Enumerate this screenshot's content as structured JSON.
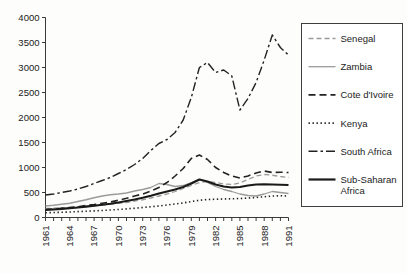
{
  "chart_data": {
    "type": "line",
    "title": "",
    "xlabel": "",
    "ylabel": "",
    "ylim": [
      0,
      4000
    ],
    "xlim": [
      1961,
      1991
    ],
    "yticks": [
      0,
      500,
      1000,
      1500,
      2000,
      2500,
      3000,
      3500,
      4000
    ],
    "ytick_labels": [
      "0",
      "500",
      "1000",
      "1500",
      "2000",
      "2500",
      "3000",
      "3500",
      "4000"
    ],
    "xticks": [
      1961,
      1964,
      1967,
      1970,
      1973,
      1976,
      1979,
      1982,
      1985,
      1988,
      1991
    ],
    "xtick_labels": [
      "1961",
      "1964",
      "1967",
      "1970",
      "1973",
      "1976",
      "1979",
      "1982",
      "1985",
      "1988",
      "1991"
    ],
    "xtick_rotation": 90,
    "x": [
      1961,
      1962,
      1963,
      1964,
      1965,
      1966,
      1967,
      1968,
      1969,
      1970,
      1971,
      1972,
      1973,
      1974,
      1975,
      1976,
      1977,
      1978,
      1979,
      1980,
      1981,
      1982,
      1983,
      1984,
      1985,
      1986,
      1987,
      1988,
      1989,
      1990,
      1991
    ],
    "grid": false,
    "legend_position": "right",
    "series": [
      {
        "name": "Senegal",
        "color": "#9a9a9a",
        "dash": "5,3",
        "width": 1.3,
        "values": [
          180,
          185,
          195,
          200,
          215,
          225,
          235,
          250,
          265,
          285,
          300,
          330,
          355,
          390,
          430,
          470,
          520,
          580,
          640,
          700,
          720,
          700,
          670,
          660,
          690,
          760,
          830,
          860,
          845,
          820,
          800
        ]
      },
      {
        "name": "Zambia",
        "color": "#9a9a9a",
        "dash": "0",
        "width": 1.3,
        "values": [
          230,
          245,
          265,
          285,
          320,
          355,
          395,
          430,
          455,
          470,
          490,
          530,
          560,
          600,
          680,
          660,
          620,
          640,
          700,
          760,
          700,
          620,
          560,
          520,
          470,
          440,
          430,
          470,
          520,
          500,
          480
        ]
      },
      {
        "name": "Cote d'Ivoire",
        "color": "#222222",
        "dash": "7,4",
        "width": 1.6,
        "values": [
          160,
          170,
          185,
          200,
          215,
          240,
          260,
          285,
          310,
          345,
          385,
          430,
          470,
          530,
          600,
          700,
          830,
          980,
          1180,
          1250,
          1160,
          1000,
          900,
          830,
          790,
          830,
          890,
          930,
          900,
          905,
          900
        ]
      },
      {
        "name": "Kenya",
        "color": "#222222",
        "dash": "1.4,2.6",
        "width": 1.6,
        "values": [
          95,
          100,
          105,
          110,
          118,
          125,
          132,
          140,
          150,
          160,
          172,
          185,
          200,
          215,
          230,
          250,
          270,
          290,
          320,
          345,
          360,
          365,
          370,
          375,
          380,
          390,
          400,
          415,
          430,
          435,
          430
        ]
      },
      {
        "name": "South Africa",
        "color": "#222222",
        "dash": "9,3,2.5,3",
        "width": 1.4,
        "values": [
          450,
          470,
          500,
          530,
          570,
          620,
          680,
          740,
          800,
          880,
          960,
          1060,
          1180,
          1340,
          1480,
          1560,
          1700,
          1950,
          2400,
          3000,
          3100,
          2900,
          2950,
          2830,
          2150,
          2380,
          2700,
          3150,
          3650,
          3400,
          3250
        ]
      },
      {
        "name": "Sub-Saharan Africa",
        "color": "#1a1a1a",
        "dash": "0",
        "width": 2.2,
        "values": [
          150,
          160,
          172,
          185,
          200,
          218,
          235,
          255,
          275,
          300,
          330,
          360,
          395,
          435,
          480,
          520,
          560,
          610,
          680,
          760,
          720,
          660,
          620,
          600,
          610,
          640,
          660,
          665,
          660,
          655,
          650
        ]
      }
    ]
  },
  "legend": {
    "entries": [
      {
        "label": "Senegal"
      },
      {
        "label": "Zambia"
      },
      {
        "label": "Cote d'Ivoire"
      },
      {
        "label": "Kenya"
      },
      {
        "label": "South Africa"
      },
      {
        "label": "Sub-Saharan",
        "label2": "Africa"
      }
    ]
  }
}
